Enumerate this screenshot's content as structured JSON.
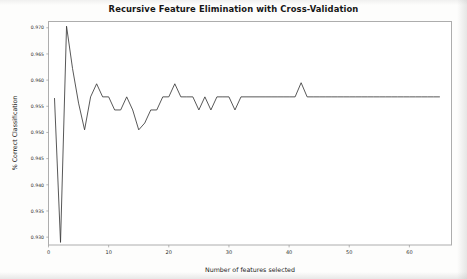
{
  "chart_data": {
    "type": "line",
    "title": "Recursive Feature Elimination with Cross-Validation",
    "xlabel": "Number of features selected",
    "ylabel": "% Correct Classification",
    "xlim": [
      0,
      67
    ],
    "ylim": [
      0.9285,
      0.9712
    ],
    "grid": false,
    "legend": null,
    "line_color": "#3a3a3a",
    "xticks": [
      0,
      10,
      20,
      30,
      40,
      50,
      60
    ],
    "xtick_labels": [
      "0",
      "10",
      "20",
      "30",
      "40",
      "50",
      "60"
    ],
    "yticks": [
      0.93,
      0.935,
      0.94,
      0.945,
      0.95,
      0.955,
      0.96,
      0.965,
      0.97
    ],
    "ytick_labels": [
      "0.930",
      "0.935",
      "0.940",
      "0.945",
      "0.950",
      "0.955",
      "0.960",
      "0.965",
      "0.970"
    ],
    "series": [
      {
        "name": "Cross-validation score",
        "x": [
          1,
          2,
          3,
          4,
          5,
          6,
          7,
          8,
          9,
          10,
          11,
          12,
          13,
          14,
          15,
          16,
          17,
          18,
          19,
          20,
          21,
          22,
          23,
          24,
          25,
          26,
          27,
          28,
          29,
          30,
          31,
          32,
          33,
          34,
          35,
          36,
          37,
          38,
          39,
          40,
          41,
          42,
          43,
          44,
          45,
          46,
          47,
          48,
          49,
          50,
          51,
          52,
          53,
          54,
          55,
          56,
          57,
          58,
          59,
          60,
          61,
          62,
          63,
          64,
          65
        ],
        "values": [
          0.9565,
          0.929,
          0.9703,
          0.9622,
          0.9556,
          0.9505,
          0.9568,
          0.9593,
          0.9568,
          0.9568,
          0.9543,
          0.9543,
          0.9568,
          0.9543,
          0.9505,
          0.9518,
          0.9543,
          0.9543,
          0.9568,
          0.9568,
          0.9593,
          0.9568,
          0.9568,
          0.9568,
          0.9543,
          0.9568,
          0.9543,
          0.9568,
          0.9568,
          0.9568,
          0.9543,
          0.9568,
          0.9568,
          0.9568,
          0.9568,
          0.9568,
          0.9568,
          0.9568,
          0.9568,
          0.9568,
          0.9568,
          0.9595,
          0.9568,
          0.9568,
          0.9568,
          0.9568,
          0.9568,
          0.9568,
          0.9568,
          0.9568,
          0.9568,
          0.9568,
          0.9568,
          0.9568,
          0.9568,
          0.9568,
          0.9568,
          0.9568,
          0.9568,
          0.9568,
          0.9568,
          0.9568,
          0.9568,
          0.9568,
          0.9568
        ]
      }
    ]
  }
}
